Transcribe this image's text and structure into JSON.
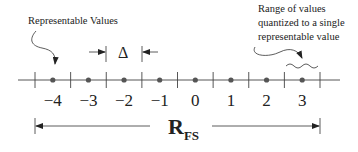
{
  "diagram": {
    "annotations": {
      "representable_values": "Representable Values",
      "range_quantized": [
        "Range of values",
        "quantized to a single",
        "representable value"
      ]
    },
    "step_label": "Δ",
    "full_scale_label": {
      "main": "R",
      "subscript": "FS"
    },
    "values": [
      -4,
      -3,
      -2,
      -1,
      0,
      1,
      2,
      3
    ],
    "value_labels": [
      "−4",
      "−3",
      "−2",
      "−1",
      "0",
      "1",
      "2",
      "3"
    ],
    "colors": {
      "ink": "#222222",
      "dot": "#555555",
      "line": "#444444"
    }
  }
}
